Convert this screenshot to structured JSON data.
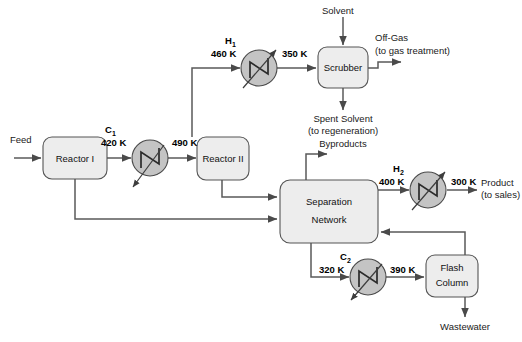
{
  "diagram": {
    "colors": {
      "unit_fill": "#ededed",
      "unit_stroke": "#555555",
      "exchanger_fill": "#c4c4c4",
      "line": "#5a5a5a",
      "text": "#1a1a1a",
      "background": "#ffffff"
    },
    "units": [
      {
        "id": "reactor1",
        "label_line1": "Reactor I",
        "label_line2": ""
      },
      {
        "id": "reactor2",
        "label_line1": "Reactor II",
        "label_line2": ""
      },
      {
        "id": "scrubber",
        "label_line1": "Scrubber",
        "label_line2": ""
      },
      {
        "id": "separation",
        "label_line1": "Separation",
        "label_line2": "Network"
      },
      {
        "id": "flash",
        "label_line1": "Flash",
        "label_line2": "Column"
      }
    ],
    "exchangers": [
      {
        "id": "C1",
        "name": "C",
        "index": "1",
        "type": "cooler",
        "inlet_temp": "420 K",
        "outlet_temp": "490 K"
      },
      {
        "id": "H1",
        "name": "H",
        "index": "1",
        "type": "heater",
        "inlet_temp": "460 K",
        "outlet_temp": "350 K"
      },
      {
        "id": "H2",
        "name": "H",
        "index": "2",
        "type": "heater",
        "inlet_temp": "400 K",
        "outlet_temp": "300 K"
      },
      {
        "id": "C2",
        "name": "C",
        "index": "2",
        "type": "cooler",
        "inlet_temp": "320 K",
        "outlet_temp": "390 K"
      }
    ],
    "streams": {
      "feed": "Feed",
      "solvent": "Solvent",
      "off_gas_line1": "Off-Gas",
      "off_gas_line2": "(to gas treatment)",
      "spent_solvent_line1": "Spent Solvent",
      "spent_solvent_line2": "(to regeneration)",
      "byproducts": "Byproducts",
      "product_line1": "Product",
      "product_line2": "(to sales)",
      "wastewater": "Wastewater"
    },
    "temperatures": {
      "t_420": "420 K",
      "t_490": "490 K",
      "t_460": "460 K",
      "t_350": "350 K",
      "t_400": "400 K",
      "t_300": "300 K",
      "t_320": "320 K",
      "t_390": "390 K"
    }
  }
}
